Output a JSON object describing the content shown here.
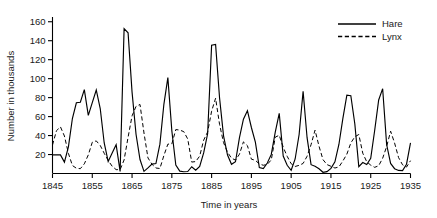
{
  "chart_data": {
    "type": "line",
    "title": "",
    "xlabel": "Time in years",
    "ylabel": "Number in thousands",
    "xlim": [
      1845,
      1935
    ],
    "ylim": [
      0,
      165
    ],
    "xticks": [
      1845,
      1855,
      1865,
      1875,
      1885,
      1895,
      1905,
      1915,
      1925,
      1935
    ],
    "yticks": [
      20,
      40,
      60,
      80,
      100,
      120,
      140,
      160
    ],
    "grid": false,
    "legend_position": "top-right",
    "x": [
      1845,
      1846,
      1847,
      1848,
      1849,
      1850,
      1851,
      1852,
      1853,
      1854,
      1855,
      1856,
      1857,
      1858,
      1859,
      1860,
      1861,
      1862,
      1863,
      1864,
      1865,
      1866,
      1867,
      1868,
      1869,
      1870,
      1871,
      1872,
      1873,
      1874,
      1875,
      1876,
      1877,
      1878,
      1879,
      1880,
      1881,
      1882,
      1883,
      1884,
      1885,
      1886,
      1887,
      1888,
      1889,
      1890,
      1891,
      1892,
      1893,
      1894,
      1895,
      1896,
      1897,
      1898,
      1899,
      1900,
      1901,
      1902,
      1903,
      1904,
      1905,
      1906,
      1907,
      1908,
      1909,
      1910,
      1911,
      1912,
      1913,
      1914,
      1915,
      1916,
      1917,
      1918,
      1919,
      1920,
      1921,
      1922,
      1923,
      1924,
      1925,
      1926,
      1927,
      1928,
      1929,
      1930,
      1931,
      1932,
      1933,
      1934,
      1935
    ],
    "series": [
      {
        "name": "Hare",
        "style": "solid",
        "color": "#000000",
        "values": [
          19.58,
          19.6,
          19.61,
          11.99,
          28.04,
          58.0,
          74.6,
          75.09,
          88.48,
          61.28,
          74.67,
          88.06,
          68.51,
          32.19,
          12.64,
          21.49,
          30.35,
          2.18,
          152.65,
          148.36,
          85.81,
          41.41,
          14.75,
          2.28,
          5.91,
          9.95,
          10.44,
          30.93,
          72.96,
          101.08,
          45.12,
          8.86,
          2.47,
          1.86,
          2.08,
          7.16,
          3.46,
          7.43,
          21.63,
          41.88,
          135.18,
          136.05,
          79.56,
          39.72,
          19.41,
          9.69,
          12.39,
          37.72,
          57.29,
          66.22,
          48.51,
          32.99,
          6.19,
          5.19,
          11.06,
          20.12,
          43.67,
          63.41,
          18.44,
          8.71,
          3.44,
          15.32,
          41.1,
          86.71,
          37.76,
          9.31,
          7.62,
          5.06,
          1.29,
          2.01,
          5.36,
          12.34,
          30.57,
          58.21,
          82.54,
          82.03,
          52.46,
          7.28,
          11.55,
          9.5,
          15.96,
          45.61,
          77.51,
          89.44,
          30.57,
          10.58,
          5.06,
          3.23,
          2.99,
          9.77,
          32.19
        ]
      },
      {
        "name": "Lynx",
        "style": "dashed",
        "color": "#000000",
        "values": [
          30.09,
          45.15,
          49.15,
          39.52,
          21.23,
          8.42,
          5.56,
          5.08,
          10.17,
          19.6,
          32.91,
          34.38,
          29.59,
          21.3,
          13.69,
          7.65,
          4.08,
          4.09,
          14.33,
          38.22,
          60.78,
          70.77,
          72.77,
          42.68,
          16.39,
          9.83,
          5.8,
          5.26,
          18.91,
          30.95,
          31.18,
          46.34,
          45.77,
          44.15,
          36.33,
          12.03,
          12.6,
          18.34,
          35.14,
          43.77,
          65.69,
          79.35,
          51.65,
          32.59,
          22.45,
          16.16,
          14.12,
          20.38,
          33.33,
          29.35,
          15.12,
          13.9,
          10.04,
          8.7,
          9.6,
          14.35,
          38.32,
          40.3,
          27.7,
          18.1,
          10.3,
          7.4,
          8.6,
          10.6,
          18.2,
          30.4,
          45.7,
          28.8,
          14.6,
          9.4,
          7.6,
          5.8,
          6.9,
          13.2,
          20.4,
          32.2,
          38.7,
          41.1,
          21.4,
          12.4,
          8.8,
          6.5,
          8.2,
          16.1,
          28.4,
          44.6,
          32.1,
          16.8,
          9.2,
          6.8,
          13.5
        ]
      }
    ]
  },
  "legend": {
    "items": [
      {
        "label": "Hare",
        "style": "solid"
      },
      {
        "label": "Lynx",
        "style": "dashed"
      }
    ]
  },
  "axes": {
    "y_title": "Number in thousands",
    "x_title": "Time in years",
    "y_tick_labels": [
      "20",
      "40",
      "60",
      "80",
      "100",
      "120",
      "140",
      "160"
    ],
    "x_tick_labels": [
      "1845",
      "1855",
      "1865",
      "1875",
      "1885",
      "1895",
      "1905",
      "1915",
      "1925",
      "1935"
    ]
  }
}
